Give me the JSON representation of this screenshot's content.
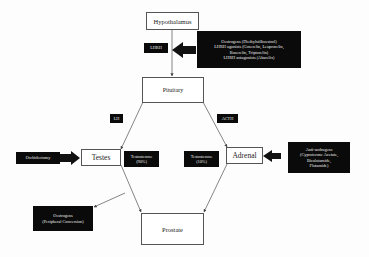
{
  "diagram": {
    "nodes": {
      "hypothalamus": "Hypothalamus",
      "pituitary": "Pituitary",
      "testes": "Testes",
      "adrenal": "Adrenal",
      "prostate": "Prostate"
    },
    "labels": {
      "lhrh": "LHRH",
      "lh": "LH",
      "acth": "ACTH",
      "testosterone_testes": [
        "Testosterone",
        "(90%)"
      ],
      "testosterone_adrenal": [
        "Testosterone",
        "(10%)"
      ]
    },
    "interventions": {
      "hypothalamic": [
        "Oestrogens (Diethylstilboestrol)",
        "LHRH agonists (Goserelin, Leuprorelin,",
        "Buserelin, Triptorelin)",
        "LHRH antagonists (Abarelix)"
      ],
      "orchidectomy": "Orchidectomy",
      "anti_androgens": [
        "Anti-androgens",
        "(Cyproterone Acetate,",
        "Bicalutamide,",
        "Flutamide)"
      ],
      "peripheral_oestrogens": [
        "Oestrogens",
        "(Peripheral Conversion)"
      ]
    },
    "colors": {
      "node_border": "#555555",
      "intervention_bg": "#0a0a0a",
      "intervention_text": "#eeeeee",
      "connector": "#666666"
    }
  }
}
